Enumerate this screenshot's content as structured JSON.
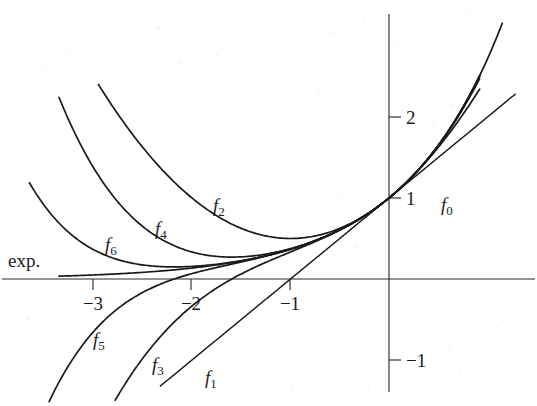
{
  "figure": {
    "background_color": "#ffffff",
    "ink_color": "#1a1a1a"
  },
  "axes": {
    "x_label": "",
    "y_label": "",
    "x_ticks": [
      {
        "value": -3,
        "label": "−3",
        "px": 93
      },
      {
        "value": -2,
        "label": "−2",
        "px": 191
      },
      {
        "value": -1,
        "label": "−1",
        "px": 290
      }
    ],
    "y_ticks": [
      {
        "value": 2,
        "label": "2",
        "px": 117
      },
      {
        "value": 1,
        "label": "1",
        "px": 198
      },
      {
        "value": -1,
        "label": "−1",
        "px": 360
      }
    ],
    "origin_px": {
      "x": 389,
      "y": 279
    },
    "unit_px": {
      "x": 98.5,
      "y": 81
    },
    "xlim": [
      -3.95,
      1.5
    ],
    "ylim": [
      -1.55,
      2.6
    ],
    "grid": false
  },
  "labels": {
    "exp": {
      "text": "exp.",
      "x_px": 8,
      "y_px": 267
    },
    "f0": {
      "base": "f",
      "sub": "0",
      "x_px": 441,
      "y_px": 211
    },
    "f1": {
      "base": "f",
      "sub": "1",
      "x_px": 205,
      "y_px": 384
    },
    "f2": {
      "base": "f",
      "sub": "2",
      "x_px": 213,
      "y_px": 212
    },
    "f3": {
      "base": "f",
      "sub": "3",
      "x_px": 152,
      "y_px": 371
    },
    "f4": {
      "base": "f",
      "sub": "4",
      "x_px": 155,
      "y_px": 235
    },
    "f5": {
      "base": "f",
      "sub": "5",
      "x_px": 93,
      "y_px": 346
    },
    "f6": {
      "base": "f",
      "sub": "6",
      "x_px": 105,
      "y_px": 251
    }
  },
  "chart_data": {
    "type": "line",
    "title": "",
    "xlabel": "",
    "ylabel": "",
    "xlim": [
      -3.95,
      1.5
    ],
    "ylim": [
      -1.55,
      2.6
    ],
    "grid": false,
    "legend": "inline-curve-labels",
    "x_ticks": [
      -3,
      -2,
      -1
    ],
    "y_ticks": [
      -1,
      1,
      2
    ],
    "series": [
      {
        "name": "exp.",
        "formula": "exp(x)",
        "degree": null,
        "x_range": [
          -3.35,
          1.15
        ],
        "points": [
          {
            "x": -3.35,
            "y": 0.035
          },
          {
            "x": -3.0,
            "y": 0.05
          },
          {
            "x": -2.5,
            "y": 0.082
          },
          {
            "x": -2.0,
            "y": 0.135
          },
          {
            "x": -1.5,
            "y": 0.223
          },
          {
            "x": -1.0,
            "y": 0.368
          },
          {
            "x": -0.5,
            "y": 0.607
          },
          {
            "x": 0.0,
            "y": 1.0
          },
          {
            "x": 0.5,
            "y": 1.649
          },
          {
            "x": 0.9,
            "y": 2.46
          },
          {
            "x": 1.15,
            "y": 3.158
          }
        ]
      },
      {
        "name": "f0",
        "formula": "1",
        "degree": 0,
        "x_range": [
          -3.95,
          1.5
        ],
        "points": [
          {
            "x": -3.95,
            "y": 1.0
          },
          {
            "x": 1.5,
            "y": 1.0
          }
        ]
      },
      {
        "name": "f1",
        "formula": "1 + x",
        "degree": 1,
        "x_range": [
          -2.32,
          1.28
        ],
        "points": [
          {
            "x": -2.32,
            "y": -1.32
          },
          {
            "x": -1.0,
            "y": 0.0
          },
          {
            "x": 0.0,
            "y": 1.0
          },
          {
            "x": 1.28,
            "y": 2.28
          }
        ]
      },
      {
        "name": "f2",
        "formula": "1 + x + x^2/2",
        "degree": 2,
        "x_range": [
          -2.95,
          0.92
        ],
        "points": [
          {
            "x": -2.95,
            "y": 2.4
          },
          {
            "x": -2.5,
            "y": 1.625
          },
          {
            "x": -2.0,
            "y": 1.0
          },
          {
            "x": -1.5,
            "y": 0.625
          },
          {
            "x": -1.0,
            "y": 0.5
          },
          {
            "x": -0.5,
            "y": 0.625
          },
          {
            "x": 0.0,
            "y": 1.0
          },
          {
            "x": 0.5,
            "y": 1.625
          },
          {
            "x": 0.92,
            "y": 2.343
          }
        ]
      },
      {
        "name": "f3",
        "formula": "1 + x + x^2/2 + x^3/6",
        "degree": 3,
        "x_range": [
          -2.78,
          0.92
        ],
        "points": [
          {
            "x": -2.78,
            "y": -1.2
          },
          {
            "x": -2.5,
            "y": -0.979
          },
          {
            "x": -2.0,
            "y": -0.333
          },
          {
            "x": -1.5,
            "y": 0.0625
          },
          {
            "x": -1.0,
            "y": 0.333
          },
          {
            "x": -0.5,
            "y": 0.604
          },
          {
            "x": 0.0,
            "y": 1.0
          },
          {
            "x": 0.5,
            "y": 1.645
          },
          {
            "x": 0.92,
            "y": 2.473
          }
        ]
      },
      {
        "name": "f4",
        "formula": "1 + x + x^2/2 + x^3/6 + x^4/24",
        "degree": 4,
        "x_range": [
          -3.35,
          0.92
        ],
        "points": [
          {
            "x": -3.35,
            "y": 2.0
          },
          {
            "x": -3.0,
            "y": 1.375
          },
          {
            "x": -2.5,
            "y": 0.63
          },
          {
            "x": -2.0,
            "y": 0.333
          },
          {
            "x": -1.5,
            "y": 0.273
          },
          {
            "x": -1.0,
            "y": 0.375
          },
          {
            "x": -0.5,
            "y": 0.607
          },
          {
            "x": 0.0,
            "y": 1.0
          },
          {
            "x": 0.5,
            "y": 1.648
          },
          {
            "x": 0.92,
            "y": 2.533
          }
        ]
      },
      {
        "name": "f5",
        "formula": "1 + x + x^2/2 + ... + x^5/120",
        "degree": 5,
        "x_range": [
          -3.45,
          0.92
        ],
        "points": [
          {
            "x": -3.45,
            "y": -1.0
          },
          {
            "x": -3.0,
            "y": -0.65
          },
          {
            "x": -2.5,
            "y": -0.184
          },
          {
            "x": -2.0,
            "y": 0.066
          },
          {
            "x": -1.5,
            "y": 0.21
          },
          {
            "x": -1.0,
            "y": 0.366
          },
          {
            "x": -0.5,
            "y": 0.607
          },
          {
            "x": 0.0,
            "y": 1.0
          },
          {
            "x": 0.5,
            "y": 1.648
          },
          {
            "x": 0.92,
            "y": 2.597
          }
        ]
      },
      {
        "name": "f6",
        "formula": "1 + x + x^2/2 + ... + x^6/720",
        "degree": 6,
        "x_range": [
          -3.65,
          0.92
        ],
        "points": [
          {
            "x": -3.65,
            "y": 0.52
          },
          {
            "x": -3.0,
            "y": 0.363
          },
          {
            "x": -2.5,
            "y": 0.155
          },
          {
            "x": -2.0,
            "y": 0.156
          },
          {
            "x": -1.5,
            "y": 0.226
          },
          {
            "x": -1.0,
            "y": 0.368
          },
          {
            "x": -0.5,
            "y": 0.607
          },
          {
            "x": 0.0,
            "y": 1.0
          },
          {
            "x": 0.5,
            "y": 1.649
          },
          {
            "x": 0.92,
            "y": 2.505
          }
        ]
      }
    ]
  }
}
